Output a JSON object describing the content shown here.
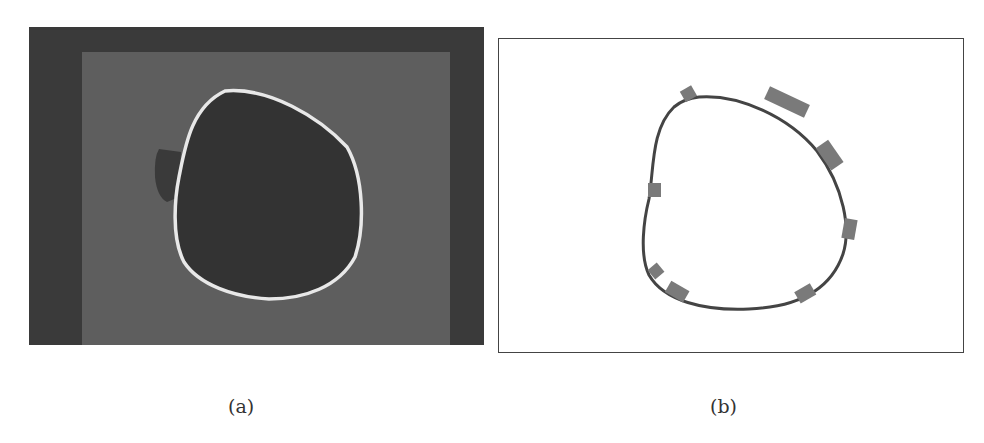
{
  "figure": {
    "panels": [
      {
        "id": "a",
        "caption": "(a)",
        "description": "Grayscale image with bright closed contour around a dark rounded region"
      },
      {
        "id": "b",
        "caption": "(b)",
        "description": "Extracted contour outline with gray rectangular segment markers along the boundary",
        "marker_count": 9
      }
    ]
  },
  "colors": {
    "outer_background": "#3a3a3a",
    "inner_background": "#5e5e5e",
    "blob_fill": "#333333",
    "contour_bright": "#e8e8e8",
    "contour_dark": "#444444",
    "marker": "#7a7a7a"
  }
}
